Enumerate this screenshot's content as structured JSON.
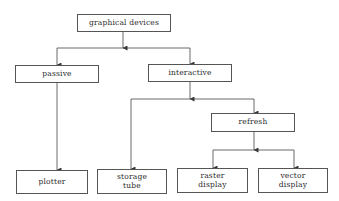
{
  "diagram": {
    "type": "tree",
    "nodes": [
      {
        "id": "graphical-devices",
        "label": "graphical devices",
        "x": 77,
        "y": 14,
        "w": 94,
        "h": 18
      },
      {
        "id": "passive",
        "label": "passive",
        "x": 15,
        "y": 65,
        "w": 84,
        "h": 18
      },
      {
        "id": "interactive",
        "label": "interactive",
        "x": 148,
        "y": 64,
        "w": 84,
        "h": 18
      },
      {
        "id": "refresh",
        "label": "refresh",
        "x": 211,
        "y": 113,
        "w": 84,
        "h": 19
      },
      {
        "id": "plotter",
        "label": "plotter",
        "x": 16,
        "y": 170,
        "w": 72,
        "h": 24
      },
      {
        "id": "storage-tube",
        "label": "storage\ntube",
        "x": 97,
        "y": 169,
        "w": 70,
        "h": 25
      },
      {
        "id": "raster-display",
        "label": "raster\ndisplay",
        "x": 177,
        "y": 168,
        "w": 71,
        "h": 25
      },
      {
        "id": "vector-display",
        "label": "vector\ndisplay",
        "x": 258,
        "y": 168,
        "w": 70,
        "h": 25
      }
    ],
    "edges": [
      {
        "from": "graphical-devices",
        "to": "passive"
      },
      {
        "from": "graphical-devices",
        "to": "interactive"
      },
      {
        "from": "passive",
        "to": "plotter"
      },
      {
        "from": "interactive",
        "to": "storage-tube"
      },
      {
        "from": "interactive",
        "to": "refresh"
      },
      {
        "from": "refresh",
        "to": "raster-display"
      },
      {
        "from": "refresh",
        "to": "vector-display"
      }
    ]
  }
}
